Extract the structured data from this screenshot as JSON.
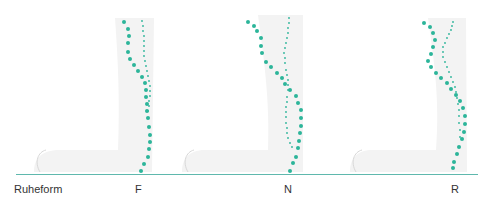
{
  "figure": {
    "labels": {
      "rest": "Ruheform",
      "f": "F",
      "n": "N",
      "r": "R"
    },
    "colors": {
      "dots": "#2cb59a",
      "baseline": "#5fb8ad",
      "silhouette": "#f1f1f1",
      "label": "#333333"
    },
    "panels": [
      {
        "name": "F",
        "large_dots": [
          [
            124,
            22
          ],
          [
            128,
            29
          ],
          [
            129,
            36
          ],
          [
            128,
            43
          ],
          [
            128,
            52
          ],
          [
            130,
            59
          ],
          [
            134,
            65
          ],
          [
            138,
            71
          ],
          [
            142,
            77
          ],
          [
            145,
            83
          ],
          [
            146,
            90
          ],
          [
            146,
            97
          ],
          [
            147,
            104
          ],
          [
            147,
            111
          ],
          [
            148,
            118
          ],
          [
            149,
            127
          ],
          [
            150,
            135
          ],
          [
            150,
            142
          ],
          [
            149,
            149
          ],
          [
            148,
            157
          ],
          [
            144,
            164
          ],
          [
            141,
            171
          ]
        ],
        "small_dots": [
          [
            142,
            21
          ],
          [
            143,
            26
          ],
          [
            143,
            31
          ],
          [
            144,
            36
          ],
          [
            144,
            41
          ],
          [
            144,
            46
          ],
          [
            144,
            51
          ],
          [
            144,
            56
          ],
          [
            145,
            61
          ],
          [
            146,
            66
          ],
          [
            147,
            71
          ],
          [
            148,
            76
          ],
          [
            149,
            81
          ],
          [
            150,
            86
          ],
          [
            150,
            91
          ],
          [
            150,
            96
          ],
          [
            149,
            101
          ],
          [
            149,
            106
          ],
          [
            148,
            111
          ]
        ]
      },
      {
        "name": "N",
        "large_dots": [
          [
            248,
            22
          ],
          [
            254,
            26
          ],
          [
            257,
            31
          ],
          [
            261,
            38
          ],
          [
            261,
            46
          ],
          [
            262,
            53
          ],
          [
            266,
            62
          ],
          [
            271,
            67
          ],
          [
            277,
            73
          ],
          [
            282,
            78
          ],
          [
            285,
            84
          ],
          [
            290,
            90
          ],
          [
            296,
            96
          ],
          [
            298,
            103
          ],
          [
            301,
            110
          ],
          [
            301,
            118
          ],
          [
            301,
            126
          ],
          [
            300,
            133
          ],
          [
            299,
            141
          ],
          [
            298,
            148
          ],
          [
            296,
            157
          ],
          [
            293,
            163
          ],
          [
            290,
            171
          ]
        ],
        "small_dots": [
          [
            289,
            18
          ],
          [
            289,
            23
          ],
          [
            288,
            28
          ],
          [
            288,
            33
          ],
          [
            287,
            38
          ],
          [
            286,
            43
          ],
          [
            285,
            48
          ],
          [
            284,
            53
          ],
          [
            285,
            58
          ],
          [
            285,
            63
          ],
          [
            286,
            70
          ],
          [
            287,
            75
          ],
          [
            288,
            80
          ],
          [
            288,
            85
          ],
          [
            288,
            90
          ],
          [
            287,
            97
          ],
          [
            287,
            102
          ],
          [
            286,
            107
          ],
          [
            286,
            112
          ],
          [
            286,
            117
          ],
          [
            286,
            123
          ],
          [
            287,
            128
          ],
          [
            287,
            133
          ],
          [
            288,
            138
          ],
          [
            290,
            143
          ],
          [
            292,
            147
          ]
        ]
      },
      {
        "name": "R",
        "large_dots": [
          [
            424,
            23
          ],
          [
            430,
            27
          ],
          [
            433,
            33
          ],
          [
            435,
            40
          ],
          [
            433,
            47
          ],
          [
            431,
            54
          ],
          [
            428,
            61
          ],
          [
            431,
            67
          ],
          [
            436,
            73
          ],
          [
            441,
            78
          ],
          [
            447,
            83
          ],
          [
            451,
            89
          ],
          [
            456,
            95
          ],
          [
            460,
            101
          ],
          [
            463,
            108
          ],
          [
            465,
            116
          ],
          [
            465,
            124
          ],
          [
            464,
            132
          ],
          [
            462,
            139
          ],
          [
            459,
            147
          ],
          [
            457,
            154
          ],
          [
            454,
            162
          ],
          [
            453,
            168
          ]
        ],
        "small_dots": [
          [
            453,
            22
          ],
          [
            452,
            26
          ],
          [
            451,
            30
          ],
          [
            449,
            34
          ],
          [
            447,
            38
          ],
          [
            445,
            43
          ],
          [
            443,
            47
          ],
          [
            443,
            52
          ],
          [
            443,
            57
          ],
          [
            445,
            62
          ],
          [
            447,
            67
          ],
          [
            449,
            72
          ],
          [
            451,
            77
          ],
          [
            453,
            82
          ],
          [
            455,
            87
          ],
          [
            456,
            92
          ],
          [
            457,
            98
          ],
          [
            458,
            104
          ],
          [
            459,
            110
          ],
          [
            459,
            116
          ],
          [
            459,
            123
          ],
          [
            460,
            130
          ],
          [
            460,
            137
          ]
        ]
      }
    ]
  }
}
